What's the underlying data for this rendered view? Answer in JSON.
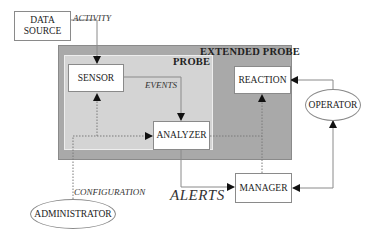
{
  "diagram": {
    "regions": {
      "extended_probe": "EXTENDED PROBE",
      "probe": "PROBE"
    },
    "nodes": {
      "data_source": [
        "DATA",
        "SOURCE"
      ],
      "sensor": "SENSOR",
      "analyzer": "ANALYZER",
      "reaction": "REACTION",
      "operator": "OPERATOR",
      "manager": "MANAGER",
      "administrator": "ADMINISTRATOR"
    },
    "edge_labels": {
      "activity": "ACTIVITY",
      "events": "EVENTS",
      "configuration": "CONFIGURATION",
      "alerts": "ALERTS"
    },
    "edges": [
      {
        "from": "data_source",
        "to": "sensor",
        "label": "ACTIVITY",
        "style": "solid"
      },
      {
        "from": "sensor",
        "to": "analyzer",
        "label": "EVENTS",
        "style": "solid"
      },
      {
        "from": "analyzer",
        "to": "manager",
        "label": "ALERTS",
        "style": "solid"
      },
      {
        "from": "operator",
        "to": "reaction",
        "style": "solid"
      },
      {
        "from": "manager",
        "to": "operator",
        "style": "solid",
        "bidirectional": true
      },
      {
        "from": "administrator",
        "to": "sensor",
        "label": "CONFIGURATION",
        "style": "dotted"
      },
      {
        "from": "administrator",
        "to": "analyzer",
        "style": "dotted"
      },
      {
        "from": "analyzer",
        "to": "reaction",
        "style": "dotted"
      },
      {
        "from": "manager",
        "to": "reaction",
        "style": "dotted"
      }
    ],
    "colors": {
      "extended_probe_fill": "#a9a9a9",
      "probe_fill": "#d4d4d4",
      "line": "#8a8a8a",
      "arrow": "#111111"
    }
  }
}
